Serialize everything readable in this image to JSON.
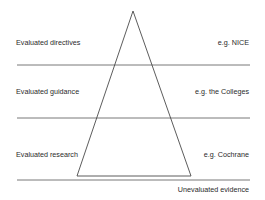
{
  "diagram": {
    "type": "evidence-hierarchy-pyramid",
    "colors": {
      "line": "#6a6a6a",
      "text": "#2a2a2a",
      "background": "#ffffff"
    },
    "tiers": [
      {
        "label": "Evaluated directives",
        "example": "e.g. NICE"
      },
      {
        "label": "Evaluated guidance",
        "example": "e.g. the Colleges"
      },
      {
        "label": "Evaluated research",
        "example": "e.g. Cochrane"
      }
    ],
    "footer": "Unevaluated evidence"
  }
}
